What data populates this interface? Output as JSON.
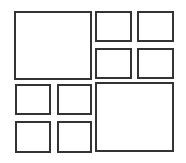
{
  "diagram": {
    "type": "collage-layout-grid",
    "border_color": "#333333",
    "background_color": "#ffffff",
    "frames": [
      {
        "id": "large-top-left",
        "x": 14,
        "y": 11,
        "w": 78,
        "h": 69
      },
      {
        "id": "small-top-right-1",
        "x": 95,
        "y": 11,
        "w": 37,
        "h": 31
      },
      {
        "id": "small-top-right-2",
        "x": 137,
        "y": 11,
        "w": 37,
        "h": 31
      },
      {
        "id": "small-top-right-3",
        "x": 95,
        "y": 48,
        "w": 37,
        "h": 31
      },
      {
        "id": "small-top-right-4",
        "x": 137,
        "y": 48,
        "w": 37,
        "h": 31
      },
      {
        "id": "small-bottom-left-1",
        "x": 15,
        "y": 84,
        "w": 36,
        "h": 31
      },
      {
        "id": "small-bottom-left-2",
        "x": 57,
        "y": 84,
        "w": 35,
        "h": 31
      },
      {
        "id": "small-bottom-left-3",
        "x": 15,
        "y": 121,
        "w": 36,
        "h": 32
      },
      {
        "id": "small-bottom-left-4",
        "x": 57,
        "y": 121,
        "w": 35,
        "h": 32
      },
      {
        "id": "large-bottom-right",
        "x": 95,
        "y": 82,
        "w": 79,
        "h": 70
      }
    ]
  }
}
